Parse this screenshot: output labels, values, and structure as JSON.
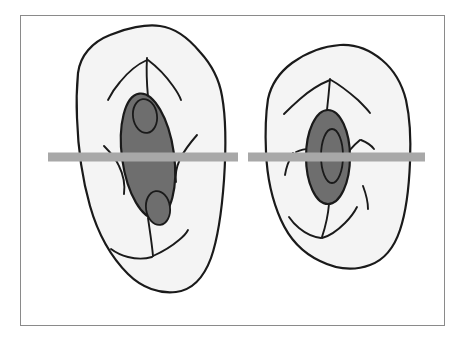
{
  "figure": {
    "title": "Two cells in cross-section with sectioning plane",
    "domain": "Diagram",
    "canvas": {
      "width": 465,
      "height": 343
    },
    "frame": {
      "name": "figure-frame",
      "x": 20,
      "y": 15,
      "width": 425,
      "height": 311,
      "stroke_color": "#8a8a8a",
      "stroke_width": 1.5,
      "fill_color": "#ffffff"
    },
    "palette": {
      "background": "#ffffff",
      "cell_fill": "#f4f4f4",
      "cell_outline": "#1a1a1a",
      "nucleus_fill": "#6e6e6e",
      "nucleus_outline": "#1a1a1a",
      "nucleolus_fill": "#6e6e6e",
      "nucleolus_outline": "#1a1a1a",
      "strand_color": "#1a1a1a",
      "section_bar": "#a8a8a8",
      "frame_stroke": "#8a8a8a"
    },
    "section_bar": {
      "label": "section-plane-bar",
      "color": "#a8a8a8",
      "y": 157,
      "thickness": 9,
      "segments": [
        {
          "name": "left-segment",
          "x1": 48,
          "x2": 238
        },
        {
          "name": "right-segment",
          "x1": 248,
          "x2": 425
        }
      ],
      "gap": {
        "x1": 238,
        "x2": 248
      }
    },
    "cells": [
      {
        "id": "cell-left",
        "label": "Left cell",
        "outline_path": "M 78 73 C 80 56 92 42 110 35 C 126 28 146 24 160 26 C 176 28 190 40 200 52 C 211 64 219 78 222 96 C 226 118 226 150 224 180 C 222 208 218 238 211 258 C 204 277 192 290 176 292 C 160 294 142 288 128 274 C 112 258 98 234 90 206 C 82 178 78 148 77 118 C 76 98 77 84 78 73 Z",
        "cytoplasm_fill": "#f4f4f4",
        "nucleus": {
          "id": "nucleus-left",
          "cx": 148,
          "cy": 156,
          "rx": 26,
          "ry": 63,
          "rotation_deg": -8,
          "fill": "#6e6e6e",
          "nucleoli": [
            {
              "id": "nucleolus-left-upper",
              "cx": 145,
              "cy": 116,
              "rx": 12,
              "ry": 17,
              "rotation_deg": -8
            },
            {
              "id": "nucleolus-left-lower",
              "cx": 158,
              "cy": 208,
              "rx": 12,
              "ry": 17,
              "rotation_deg": -8
            }
          ]
        },
        "strands": [
          "M 147 58 C 146 74 147 86 148 97",
          "M 147 60 C 138 64 128 72 120 82 C 113 90 110 96 108 100",
          "M 148 60 C 156 66 166 76 173 86 C 178 93 180 97 181 100",
          "M 197 135 C 190 143 184 151 180 159 C 176 168 175 176 176 182",
          "M 104 146 C 110 152 116 159 119 166 C 124 176 125 186 124 194",
          "M 148 218 C 150 232 152 244 153 256",
          "M 152 257 C 145 259 136 259 128 257 C 120 255 115 252 111 249",
          "M 153 256 C 162 252 172 246 179 240 C 184 236 187 232 188 230"
        ]
      },
      {
        "id": "cell-right",
        "label": "Right cell",
        "outline_path": "M 268 99 C 271 85 280 72 292 63 C 306 53 324 46 340 45 C 356 44 370 50 382 60 C 394 70 402 84 406 100 C 410 118 411 140 410 162 C 409 188 406 212 400 230 C 394 248 384 260 370 265 C 354 271 336 269 320 261 C 303 253 289 238 281 220 C 272 200 267 176 266 152 C 265 130 266 112 268 99 Z",
        "cytoplasm_fill": "#f4f4f4",
        "nucleus": {
          "id": "nucleus-right",
          "cx": 328,
          "cy": 157,
          "rx": 22,
          "ry": 47,
          "rotation_deg": 0,
          "fill": "#6e6e6e",
          "nucleoli": [
            {
              "id": "nucleolus-right-center",
              "cx": 332,
              "cy": 156,
              "rx": 11,
              "ry": 27,
              "rotation_deg": 0
            }
          ]
        },
        "strands": [
          "M 330 79 C 329 91 328 101 327 110",
          "M 330 80 C 320 84 309 91 300 99 C 292 106 287 111 284 114",
          "M 331 80 C 340 85 350 93 358 100 C 364 106 368 110 370 113",
          "M 360 140 C 354 145 348 151 345 158 C 342 166 342 172 344 177",
          "M 361 140 C 366 142 371 145 374 149",
          "M 296 152 C 303 149 310 148 315 150",
          "M 293 153 C 289 160 286 168 285 175",
          "M 329 204 C 328 216 325 228 322 237",
          "M 321 238 C 313 237 305 233 299 228 C 294 224 291 220 289 217",
          "M 322 238 C 330 236 338 230 345 223 C 351 217 355 211 357 207",
          "M 363 186 C 366 194 368 202 368 209"
        ]
      }
    ]
  }
}
